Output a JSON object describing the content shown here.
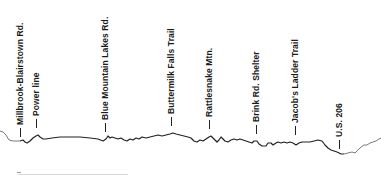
{
  "diagram": {
    "type": "elevation-profile",
    "line_color": "#222222",
    "faded_line_color": "#7a7a7a",
    "text_color": "#1a1a1a",
    "background": "#ffffff",
    "landmarks": [
      {
        "id": "millbrook",
        "label": "Millbrook-Blairstown Rd.",
        "x": 21,
        "tick_bottom": 136
      },
      {
        "id": "power-line",
        "label": "Power line",
        "x": 37,
        "tick_bottom": 127
      },
      {
        "id": "blue-mountain",
        "label": "Blue Mountain Lakes Rd.",
        "x": 106,
        "tick_bottom": 131
      },
      {
        "id": "buttermilk",
        "label": "Buttermilk Falls Trail",
        "x": 172,
        "tick_bottom": 125
      },
      {
        "id": "rattlesnake",
        "label": "Rattlesnake Mtn.",
        "x": 210,
        "tick_bottom": 128
      },
      {
        "id": "brink-rd",
        "label": "Brink Rd. Shelter",
        "x": 257,
        "tick_bottom": 133
      },
      {
        "id": "jacobs-ladder",
        "label": "Jacob's Ladder Trail",
        "x": 296,
        "tick_bottom": 134
      },
      {
        "id": "us-206",
        "label": "U.S. 206",
        "x": 340,
        "tick_bottom": 148
      }
    ]
  }
}
